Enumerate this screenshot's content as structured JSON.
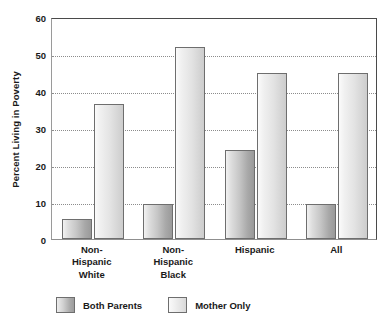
{
  "chart_data": {
    "type": "bar",
    "title": "",
    "xlabel": "",
    "ylabel": "Percent Living in Poverty",
    "categories": [
      "Non-Hispanic White",
      "Non-Hispanic Black",
      "Hispanic",
      "All"
    ],
    "category_lines": [
      [
        "Non-",
        "Hispanic",
        "White"
      ],
      [
        "Non-",
        "Hispanic",
        "Black"
      ],
      [
        "Hispanic"
      ],
      [
        "All"
      ]
    ],
    "series": [
      {
        "name": "Both Parents",
        "values": [
          5.5,
          9.5,
          24,
          9.5
        ]
      },
      {
        "name": "Mother Only",
        "values": [
          36.5,
          52,
          45,
          45
        ]
      }
    ],
    "ylim": [
      0,
      60
    ],
    "yticks": [
      0,
      10,
      20,
      30,
      40,
      50,
      60
    ],
    "ytick_labels": [
      "0",
      "10",
      "20",
      "30",
      "40",
      "50",
      "60"
    ],
    "grid": true,
    "grid_style": "dotted-horizontal",
    "legend_position": "bottom-left",
    "colors": {
      "both_parents_light": "#ededed",
      "both_parents_dark": "#9a9a9a",
      "mother_only_light": "#fbfbfb",
      "mother_only_dark": "#cdcdcd",
      "bar_outline": "#6e6e6e",
      "gridline": "#8c8c8c",
      "axis": "#4a4a4a",
      "text": "#1a1a1a",
      "background": "#ffffff"
    }
  },
  "legend": {
    "items": [
      {
        "label": "Both Parents",
        "swatch": "both"
      },
      {
        "label": "Mother Only",
        "swatch": "mother"
      }
    ]
  }
}
